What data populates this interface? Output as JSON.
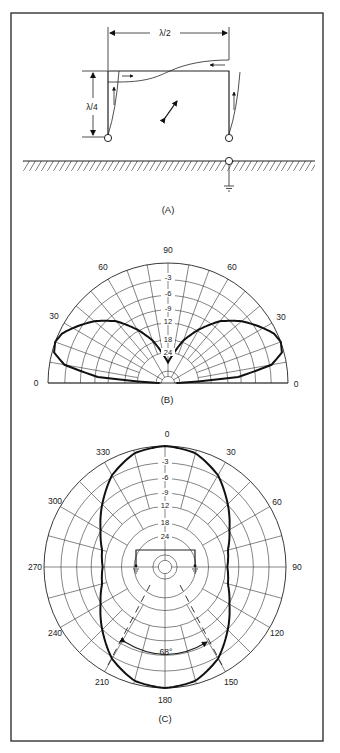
{
  "figure": {
    "frame": {
      "x": 11,
      "y": 13,
      "width": 312,
      "height": 728
    },
    "panel_a": {
      "caption": "(A)",
      "dimension_horizontal": "λ/2",
      "dimension_vertical": "λ/4",
      "elements": [
        "half-wave horizontal top wire",
        "two quarter-wave vertical legs",
        "ground plane",
        "feed point with ground connection",
        "current distribution curves with arrows",
        "polarization arrow"
      ]
    },
    "panel_b": {
      "caption": "(B)",
      "type": "elevation pattern",
      "angle_labels": [
        "0",
        "30",
        "60",
        "90",
        "60",
        "30",
        "0"
      ],
      "ring_labels": [
        "-3",
        "-6",
        "-9",
        "12",
        "18",
        "24"
      ]
    },
    "panel_c": {
      "caption": "(C)",
      "type": "azimuth pattern",
      "angle_labels": [
        "0",
        "30",
        "60",
        "90",
        "120",
        "150",
        "180",
        "210",
        "240",
        "270",
        "300",
        "330"
      ],
      "ring_labels": [
        "-3",
        "-6",
        "-9",
        "12",
        "18",
        "24"
      ],
      "beamwidth_label": "68°"
    }
  },
  "chart_data": [
    {
      "type": "polar",
      "title": "(B) Elevation pattern",
      "angular_axis": {
        "range_deg": [
          0,
          180
        ],
        "ticks": [
          0,
          30,
          60,
          90,
          120,
          150,
          180
        ],
        "tick_labels": [
          "0",
          "30",
          "60",
          "90",
          "60",
          "30",
          "0"
        ],
        "spacing_deg": 10
      },
      "radial_axis": {
        "unit": "dB",
        "ring_labels": [
          "-3",
          "-6",
          "-9",
          "12",
          "18",
          "24"
        ],
        "ring_values": [
          0,
          -3,
          -6,
          -9,
          -12,
          -18,
          -24
        ]
      },
      "series": [
        {
          "name": "elevation response",
          "elevation_deg": [
            0,
            5,
            10,
            15,
            20,
            25,
            30,
            40,
            50,
            60,
            70,
            80,
            90
          ],
          "relative_db": [
            -30,
            -6,
            -1.5,
            -0.2,
            0,
            -0.3,
            -1,
            -2.5,
            -4.5,
            -7.5,
            -11,
            -16,
            -20
          ]
        }
      ],
      "grid": true
    },
    {
      "type": "polar",
      "title": "(C) Azimuth pattern",
      "angular_axis": {
        "range_deg": [
          0,
          360
        ],
        "ticks": [
          0,
          30,
          60,
          90,
          120,
          150,
          180,
          210,
          240,
          270,
          300,
          330
        ],
        "spacing_deg": 15
      },
      "radial_axis": {
        "unit": "dB",
        "ring_labels": [
          "-3",
          "-6",
          "-9",
          "12",
          "18",
          "24"
        ],
        "ring_values": [
          0,
          -3,
          -6,
          -9,
          -12,
          -18,
          -24
        ]
      },
      "series": [
        {
          "name": "azimuth response",
          "azimuth_deg": [
            0,
            15,
            30,
            45,
            60,
            75,
            90,
            105,
            120,
            135,
            150,
            165,
            180
          ],
          "relative_db": [
            0,
            -0.3,
            -1.5,
            -3.5,
            -5.5,
            -7,
            -7.5,
            -7,
            -5.5,
            -3.5,
            -1.5,
            -0.3,
            0
          ],
          "symmetric": true
        }
      ],
      "annotations": [
        {
          "text": "68°",
          "meaning": "half-power beamwidth"
        }
      ],
      "grid": true
    }
  ]
}
